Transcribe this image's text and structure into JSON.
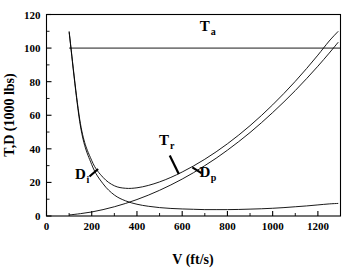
{
  "chart_data": {
    "type": "line",
    "title": "",
    "xlabel": "V (ft/s)",
    "ylabel": "T,D (1000 lbs)",
    "xlim": [
      0,
      1300
    ],
    "ylim": [
      0,
      120
    ],
    "xticks": [
      0,
      200,
      400,
      600,
      800,
      1000,
      1200
    ],
    "xtick_labels": [
      "0",
      "200",
      "400",
      "600",
      "800",
      "1000",
      "1200"
    ],
    "xtick_minor_step": 100,
    "yticks": [
      0,
      20,
      40,
      60,
      80,
      100,
      120
    ],
    "ytick_labels": [
      "0",
      "20",
      "40",
      "60",
      "80",
      "100",
      "120"
    ],
    "ytick_minor_step": 10,
    "grid": false,
    "legend": "none",
    "annotations": [
      {
        "name": "Ta",
        "base": "T",
        "sub": "a",
        "text": "Ta",
        "x": 700,
        "y": 110,
        "pointer": false
      },
      {
        "name": "Tr",
        "base": "T",
        "sub": "r",
        "text": "Tr",
        "x": 520,
        "y": 42,
        "pointer": true
      },
      {
        "name": "Dp",
        "base": "D",
        "sub": "p",
        "text": "Dp",
        "x": 700,
        "y": 23,
        "pointer": true
      },
      {
        "name": "Di",
        "base": "D",
        "sub": "i",
        "text": "Di",
        "x": 150,
        "y": 22,
        "pointer": true
      }
    ],
    "series": [
      {
        "name": "Ta",
        "label": "Thrust available",
        "style": "horizontal-line",
        "x": [
          100,
          1300
        ],
        "values": [
          100,
          100
        ]
      },
      {
        "name": "Tr",
        "label": "Thrust required (total drag)",
        "style": "u-curve",
        "x": [
          100,
          150,
          200,
          250,
          300,
          350,
          400,
          450,
          500,
          550,
          600,
          650,
          700,
          750,
          800,
          850,
          900,
          950,
          1000,
          1050,
          1100,
          1150,
          1200,
          1250,
          1290
        ],
        "values": [
          110,
          55,
          33,
          23,
          18,
          16.5,
          16.8,
          18.2,
          20.3,
          23.0,
          26.2,
          29.8,
          33.8,
          38.2,
          43.0,
          48.2,
          53.8,
          59.8,
          66.2,
          73.0,
          80.2,
          87.8,
          95.8,
          104.2,
          110.0
        ]
      },
      {
        "name": "Dp",
        "label": "Parasite drag",
        "style": "rising-curve",
        "x": [
          100,
          150,
          200,
          250,
          300,
          350,
          400,
          450,
          500,
          550,
          600,
          650,
          700,
          750,
          800,
          850,
          900,
          950,
          1000,
          1050,
          1100,
          1150,
          1200,
          1250,
          1290
        ],
        "values": [
          0.6,
          1.4,
          2.4,
          3.8,
          5.5,
          7.5,
          9.8,
          12.4,
          15.3,
          18.5,
          22.0,
          25.8,
          30.0,
          34.4,
          39.2,
          44.3,
          49.7,
          55.5,
          61.6,
          68.0,
          74.7,
          81.8,
          89.2,
          97.0,
          103.5
        ]
      },
      {
        "name": "Di",
        "label": "Induced drag",
        "style": "decaying-curve",
        "x": [
          100,
          150,
          200,
          250,
          300,
          350,
          400,
          450,
          500,
          550,
          600,
          650,
          700,
          750,
          800,
          850,
          900,
          950,
          1000,
          1050,
          1100,
          1150,
          1200,
          1250,
          1290
        ],
        "values": [
          109.4,
          53.6,
          30.6,
          19.2,
          12.5,
          9.0,
          7.0,
          5.8,
          5.0,
          4.5,
          4.2,
          4.0,
          3.8,
          3.8,
          3.8,
          3.9,
          4.1,
          4.3,
          4.6,
          5.0,
          5.5,
          6.0,
          6.6,
          7.2,
          7.5
        ]
      }
    ]
  }
}
